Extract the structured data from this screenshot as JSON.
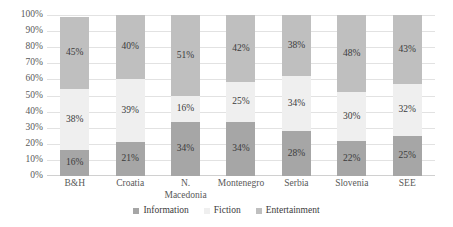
{
  "chart_data": {
    "type": "bar",
    "subtype": "stacked-100-percent",
    "title": "",
    "subtitle": "",
    "xlabel": "",
    "ylabel": "",
    "ylim": [
      0,
      100
    ],
    "y_tick_labels": [
      "100%",
      "90%",
      "80%",
      "70%",
      "60%",
      "50%",
      "40%",
      "30%",
      "20%",
      "10%",
      "0%"
    ],
    "y_tick_values": [
      100,
      90,
      80,
      70,
      60,
      50,
      40,
      30,
      20,
      10,
      0
    ],
    "grid": true,
    "legend_position": "bottom",
    "categories": [
      "B&H",
      "Croatia",
      "N.\nMacedonia",
      "Montenegro",
      "Serbia",
      "Slovenia",
      "SEE"
    ],
    "series": [
      {
        "name": "Information",
        "color": "#a6a6a6",
        "values": [
          16,
          21,
          34,
          34,
          28,
          22,
          25
        ],
        "labels": [
          "16%",
          "21%",
          "34%",
          "34%",
          "28%",
          "22%",
          "25%"
        ]
      },
      {
        "name": "Fiction",
        "color": "#efefef",
        "values": [
          38,
          39,
          16,
          25,
          34,
          30,
          32
        ],
        "labels": [
          "38%",
          "39%",
          "16%",
          "25%",
          "34%",
          "30%",
          "32%"
        ]
      },
      {
        "name": "Entertainment",
        "color": "#bfbfbf",
        "values": [
          45,
          40,
          51,
          42,
          38,
          48,
          43
        ],
        "labels": [
          "45%",
          "40%",
          "51%",
          "42%",
          "38%",
          "48%",
          "43%"
        ]
      }
    ]
  },
  "legend": {
    "items": [
      {
        "label": "Information",
        "color": "#a6a6a6"
      },
      {
        "label": "Fiction",
        "color": "#efefef"
      },
      {
        "label": "Entertainment",
        "color": "#bfbfbf"
      }
    ]
  }
}
